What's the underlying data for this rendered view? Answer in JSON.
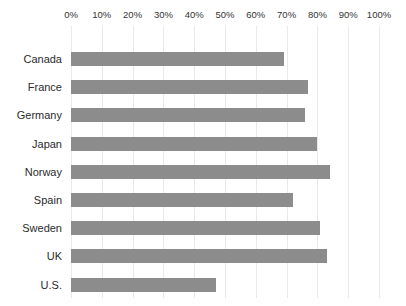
{
  "chart_data": {
    "type": "bar",
    "orientation": "horizontal",
    "title": "",
    "xlabel": "",
    "ylabel": "",
    "categories": [
      "Canada",
      "France",
      "Germany",
      "Japan",
      "Norway",
      "Spain",
      "Sweden",
      "UK",
      "U.S."
    ],
    "values": [
      69,
      77,
      76,
      80,
      84,
      72,
      81,
      83,
      47
    ],
    "value_unit": "%",
    "xlim": [
      0,
      100
    ],
    "x_ticks": [
      0,
      10,
      20,
      30,
      40,
      50,
      60,
      70,
      80,
      90,
      100
    ],
    "x_tick_labels": [
      "0%",
      "10%",
      "20%",
      "30%",
      "40%",
      "50%",
      "60%",
      "70%",
      "80%",
      "90%",
      "100%"
    ],
    "grid": "vertical",
    "legend": "none",
    "axis_position": "top",
    "colors": {
      "bar": "#8c8c8c",
      "gridline": "#e9e9e9",
      "axis_text": "#333333",
      "label_text": "#2b2b2b",
      "background": "#ffffff"
    }
  }
}
